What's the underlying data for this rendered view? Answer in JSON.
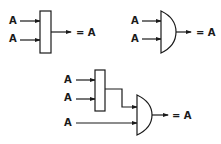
{
  "diagrams": [
    {
      "name": "or-idempotence",
      "inputs": [
        "A",
        "A"
      ],
      "gate": "OR",
      "output": "= A"
    },
    {
      "name": "and-idempotence",
      "inputs": [
        "A",
        "A"
      ],
      "gate": "AND",
      "output": "= A"
    },
    {
      "name": "combined",
      "first_gate_inputs": [
        "A",
        "A"
      ],
      "first_gate": "OR",
      "second_gate_extra_input": "A",
      "second_gate": "AND",
      "output": "= A"
    }
  ],
  "colors": {
    "line": "#1a1a1a",
    "background": "#ffffff"
  }
}
